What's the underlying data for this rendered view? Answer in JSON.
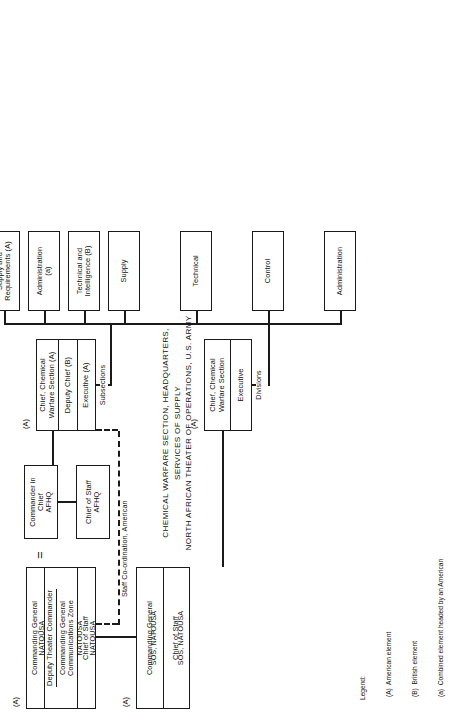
{
  "chart": {
    "title_line1": "CHEMICAL WARFARE SECTION, HEADQUARTERS, SERVICES OF SUPPLY",
    "title_line2": "NORTH AFRICAN THEATER OF OPERATIONS, U.S. ARMY",
    "equals_symbol": "=",
    "relation_label": "Staff Co-ordination, American",
    "group_label_subsections": "Subsections",
    "group_label_divisions": "Divisions"
  },
  "natousa_group": {
    "tag": "(A)",
    "rows": [
      {
        "lines": [
          "Commanding General",
          "NATOUSA"
        ]
      },
      {
        "lines": [
          "Deputy Theater Commander",
          "Commanding General",
          "Communications Zone",
          "NATOUSA"
        ],
        "rule_after_line": 1
      },
      {
        "lines": [
          "Chief of Staff",
          "NATOUSA"
        ]
      }
    ]
  },
  "afhq_cinc": {
    "lines": [
      "Commander in Chief",
      "AFHQ"
    ]
  },
  "afhq_cos": {
    "lines": [
      "Chief of Staff",
      "AFHQ"
    ]
  },
  "sos_group": {
    "tag": "(A)",
    "rows": [
      {
        "lines": [
          "Commanding General",
          "SOS, NATOUSA"
        ]
      },
      {
        "lines": [
          "Chief of Staff",
          "SOS, NATOUSA"
        ]
      }
    ]
  },
  "cws_afhq": {
    "tag": "(A)",
    "rows": [
      {
        "lines": [
          "Chief, Chemical",
          "Warfare Section (A)"
        ]
      },
      {
        "lines": [
          "Deputy Chief      (B)"
        ]
      },
      {
        "lines": [
          "Executive          (A)"
        ]
      }
    ]
  },
  "subsections": [
    {
      "lines": [
        "Administration",
        "(a)"
      ]
    },
    {
      "lines": [
        "Technical and",
        "Intelligence   (B)"
      ]
    },
    {
      "lines": [
        "Operating and",
        "Training      (A)"
      ]
    },
    {
      "lines": [
        "Supply and",
        "Requirements (A)"
      ]
    }
  ],
  "cws_sos": {
    "tag": "(A)",
    "rows": [
      {
        "lines": [
          "Chief, Chemical",
          "Warfare Section"
        ]
      },
      {
        "lines": [
          "Executive"
        ]
      }
    ]
  },
  "divisions": [
    {
      "lines": [
        "Administration"
      ]
    },
    {
      "lines": [
        "Control"
      ]
    },
    {
      "lines": [
        "Technical"
      ]
    },
    {
      "lines": [
        "Supply"
      ]
    }
  ],
  "legend": {
    "heading": "Legend:",
    "items": [
      "(A)  American element",
      "(B)  British element",
      "(a)  Combined element headed by an American"
    ]
  }
}
